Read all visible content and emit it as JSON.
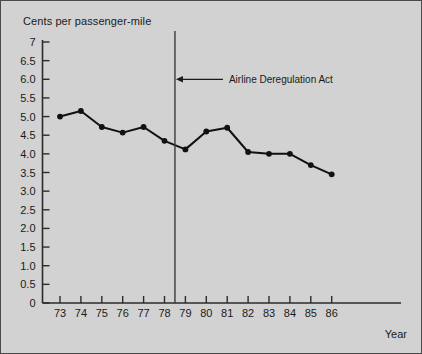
{
  "figure": {
    "background_color": "#d2d2d2",
    "border_color": "#4a4a4a",
    "title": "Cents per passenger-mile",
    "xlabel": "Year"
  },
  "chart_data": {
    "type": "line",
    "title": "Cents per passenger-mile",
    "xlabel": "Year",
    "ylabel": "Cents per passenger-mile",
    "categories": [
      "73",
      "74",
      "75",
      "76",
      "77",
      "78",
      "79",
      "80",
      "81",
      "82",
      "83",
      "84",
      "85",
      "86"
    ],
    "x": [
      73,
      74,
      75,
      76,
      77,
      78,
      79,
      80,
      81,
      82,
      83,
      84,
      85,
      86
    ],
    "values": [
      5.0,
      5.15,
      4.72,
      4.57,
      4.72,
      4.35,
      4.12,
      4.6,
      4.7,
      4.05,
      4.0,
      4.0,
      3.7,
      3.45
    ],
    "series": [
      {
        "name": "Cents per passenger-mile",
        "values": [
          5.0,
          5.15,
          4.72,
          4.57,
          4.72,
          4.35,
          4.12,
          4.6,
          4.7,
          4.05,
          4.0,
          4.0,
          3.7,
          3.45
        ]
      }
    ],
    "ylim": [
      0,
      7
    ],
    "xlim": [
      72.5,
      87.5
    ],
    "ytick_labels": [
      "7",
      "6.5",
      "6.0",
      "5.5",
      "5.0",
      "4.5",
      "4.0",
      "3.5",
      "3.0",
      "2.5",
      "2.0",
      "1.5",
      "1.0",
      "0.5",
      "0"
    ],
    "ytick_values": [
      7,
      6.5,
      6.0,
      5.5,
      5.0,
      4.5,
      4.0,
      3.5,
      3.0,
      2.5,
      2.0,
      1.5,
      1.0,
      0.5,
      0
    ],
    "xtick_labels": [
      "73",
      "74",
      "75",
      "76",
      "77",
      "78",
      "79",
      "80",
      "81",
      "82",
      "83",
      "84",
      "85",
      "86"
    ],
    "grid": false,
    "legend": "none",
    "line_color": "#111111",
    "marker": "circle",
    "marker_color": "#111111",
    "annotations": [
      {
        "text": "Airline Deregulation Act",
        "type": "vertical-line-with-arrow",
        "x_value": 78.5,
        "arrow_direction": "left",
        "label_y_value": 6.0,
        "color": "#3a3a3a"
      }
    ]
  }
}
